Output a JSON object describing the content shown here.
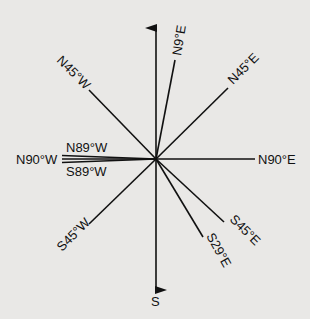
{
  "diagram": {
    "type": "compass-bearings",
    "center": [
      156,
      159
    ],
    "bearings": [
      {
        "label": "N",
        "angle_deg": 0,
        "arrow": true,
        "show_label": false
      },
      {
        "label": "N9°E",
        "angle_deg": 9
      },
      {
        "label": "N45°E",
        "angle_deg": 45
      },
      {
        "label": "N90°E",
        "angle_deg": 90
      },
      {
        "label": "S45°E",
        "angle_deg": 135
      },
      {
        "label": "S29°E",
        "angle_deg": 151
      },
      {
        "label": "S",
        "angle_deg": 180,
        "arrow": true
      },
      {
        "label": "S45°W",
        "angle_deg": 225
      },
      {
        "label": "S89°W",
        "angle_deg": 271
      },
      {
        "label": "N90°W",
        "angle_deg": 270
      },
      {
        "label": "N89°W",
        "angle_deg": 269
      },
      {
        "label": "N45°W",
        "angle_deg": 315
      }
    ]
  },
  "labels": {
    "n9e": "N9°E",
    "n45e": "N45°E",
    "n90e": "N90°E",
    "s45e": "S45°E",
    "s29e": "S29°E",
    "s": "S",
    "s45w": "S45°W",
    "s89w": "S89°W",
    "n90w": "N90°W",
    "n89w": "N89°W",
    "n45w": "N45°W"
  }
}
